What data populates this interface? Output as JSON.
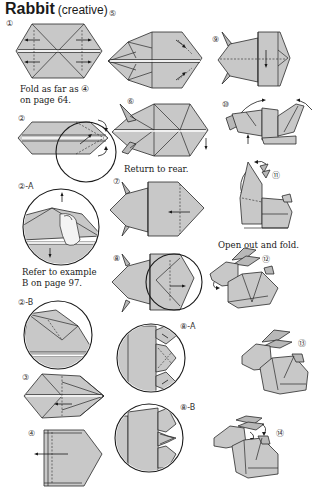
{
  "page": {
    "title": "Rabbit",
    "subtitle": "(creative)"
  },
  "steps": [
    {
      "id": "1",
      "label": "①",
      "caption": [
        "Fold as far as ④",
        "on page 64."
      ]
    },
    {
      "id": "2",
      "label": "②",
      "caption": []
    },
    {
      "id": "2-A",
      "label": "②-A",
      "caption": [
        "Refer to example",
        "B on page 97."
      ]
    },
    {
      "id": "2-B",
      "label": "②-B",
      "caption": []
    },
    {
      "id": "3",
      "label": "③",
      "caption": []
    },
    {
      "id": "4",
      "label": "④",
      "caption": []
    },
    {
      "id": "5",
      "label": "⑤",
      "caption": []
    },
    {
      "id": "6",
      "label": "⑥",
      "caption": [
        "Return to rear."
      ]
    },
    {
      "id": "7",
      "label": "⑦",
      "caption": []
    },
    {
      "id": "8",
      "label": "⑧",
      "caption": []
    },
    {
      "id": "8-A",
      "label": "⑧-A",
      "caption": []
    },
    {
      "id": "8-B",
      "label": "⑧-B",
      "caption": []
    },
    {
      "id": "9",
      "label": "⑨",
      "caption": []
    },
    {
      "id": "10",
      "label": "⑩",
      "caption": []
    },
    {
      "id": "11",
      "label": "⑪",
      "caption": [
        "Open out and fold."
      ]
    },
    {
      "id": "12",
      "label": "⑫",
      "caption": []
    },
    {
      "id": "13",
      "label": "⑬",
      "caption": []
    },
    {
      "id": "14",
      "label": "⑭",
      "caption": []
    }
  ],
  "colors": {
    "paper": "#c8c8c8",
    "line": "#2a2a2a",
    "background": "#ffffff"
  }
}
